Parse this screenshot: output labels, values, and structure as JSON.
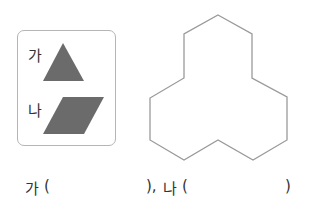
{
  "pieces": {
    "a": {
      "label": "가",
      "shape": "triangle",
      "color": "#6b6b6b"
    },
    "b": {
      "label": "나",
      "shape": "parallelogram",
      "color": "#6b6b6b"
    }
  },
  "figure": {
    "shape": "trefoil-12-gon",
    "stroke": "#999999"
  },
  "answer": {
    "a_label": "가",
    "open_paren": "(",
    "close_paren_a": "),",
    "b_label": "나",
    "close_paren_b": ")"
  }
}
